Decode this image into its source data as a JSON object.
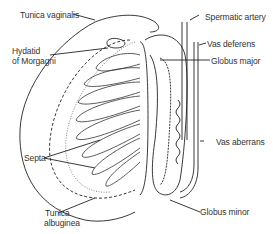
{
  "labels": {
    "tunica_vaginalis": "Tunica vaginalis",
    "hydatid_line1": "Hydatid",
    "hydatid_line2": "of Morgagni",
    "spermatic_artery": "Spermatic artery",
    "vas_deferens": "Vas deferens",
    "globus_major": "Globus major",
    "septa": "Septa",
    "vas_aberrans": "Vas aberrans",
    "tunica_albuginea_line1": "Tunica",
    "tunica_albuginea_line2": "albuginea",
    "globus_minor": "Globus minor"
  },
  "colors": {
    "line": "#222222",
    "dotted": "#777777",
    "text": "#333333",
    "background": "#ffffff"
  }
}
